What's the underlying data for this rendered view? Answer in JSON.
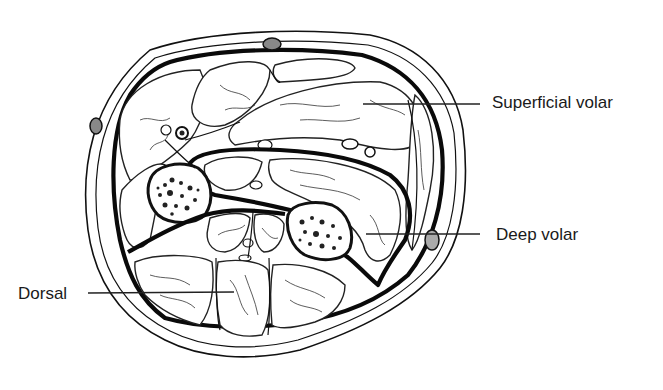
{
  "figure": {
    "colors": {
      "line": "#111111",
      "background": "#ffffff"
    }
  },
  "labels": [
    {
      "id": "superficial-volar",
      "text": "Superficial volar",
      "x": 492,
      "y": 92,
      "leader": {
        "x1": 363,
        "y1": 104,
        "x2": 480,
        "y2": 104
      }
    },
    {
      "id": "deep-volar",
      "text": "Deep volar",
      "x": 496,
      "y": 226,
      "leader": {
        "x1": 366,
        "y1": 234,
        "x2": 480,
        "y2": 234
      }
    },
    {
      "id": "dorsal",
      "text": "Dorsal",
      "x": 18,
      "y": 286,
      "leader": {
        "x1": 88,
        "y1": 293,
        "x2": 234,
        "y2": 292
      }
    }
  ]
}
